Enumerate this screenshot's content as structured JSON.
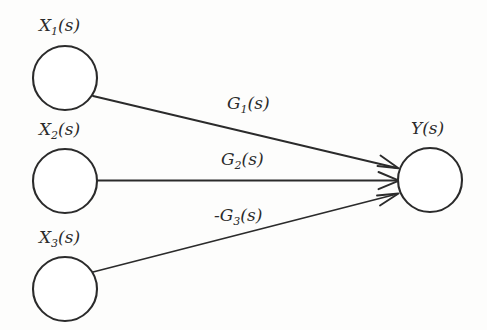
{
  "diagram": {
    "type": "signal-flow-graph",
    "background_color": "#fdfdfc",
    "stroke_color": "#2b2b2b",
    "node_fill_color": "#ffffff",
    "nodes": [
      {
        "id": "x1",
        "label": "X",
        "subscript": "1",
        "argument": "(s)",
        "full_label": "X1(s)",
        "cx": 65,
        "cy": 78,
        "r": 32,
        "role": "input"
      },
      {
        "id": "x2",
        "label": "X",
        "subscript": "2",
        "argument": "(s)",
        "full_label": "X2(s)",
        "cx": 65,
        "cy": 181,
        "r": 32,
        "role": "input"
      },
      {
        "id": "x3",
        "label": "X",
        "subscript": "3",
        "argument": "(s)",
        "full_label": "X3(s)",
        "cx": 65,
        "cy": 289,
        "r": 32,
        "role": "input"
      },
      {
        "id": "y",
        "label": "Y",
        "subscript": "",
        "argument": "(s)",
        "full_label": "Y(s)",
        "cx": 430,
        "cy": 180,
        "r": 32,
        "role": "output"
      }
    ],
    "edges": [
      {
        "id": "g1",
        "from": "x1",
        "to": "y",
        "sign": "",
        "label": "G",
        "subscript": "1",
        "argument": "(s)",
        "full_label": "G1(s)",
        "arrow": "open-barb"
      },
      {
        "id": "g2",
        "from": "x2",
        "to": "y",
        "sign": "",
        "label": "G",
        "subscript": "2",
        "argument": "(s)",
        "full_label": "G2(s)",
        "arrow": "open-barb"
      },
      {
        "id": "g3",
        "from": "x3",
        "to": "y",
        "sign": "-",
        "label": "G",
        "subscript": "3",
        "argument": "(s)",
        "full_label": "-G3(s)",
        "arrow": "open-barb"
      }
    ]
  }
}
